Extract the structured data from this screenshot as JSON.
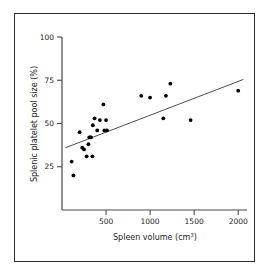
{
  "figure": {
    "background_color": "#ffffff",
    "frame_color": "#2b2b2b",
    "point_color": "#000000",
    "line_color": "#3a3a3a",
    "axis_color": "#4a4a4a"
  },
  "chart_data": {
    "type": "scatter",
    "title": "",
    "subtitle": "",
    "xlabel": "Spleen volume (cm",
    "xlabel_sup": "3",
    "xlabel_tail": ")",
    "xlabel_full": "Spleen volume (cm3)",
    "ylabel": "Splenic platelet pool size (%)",
    "xlim": [
      0,
      2100
    ],
    "ylim": [
      0,
      100
    ],
    "xticks": [
      500,
      1000,
      1500,
      2000
    ],
    "xtick_labels": [
      "500",
      "1000",
      "1500",
      "2000"
    ],
    "yticks": [
      25,
      50,
      75,
      100
    ],
    "ytick_labels": [
      "25",
      "50",
      "75",
      "100"
    ],
    "grid": false,
    "legend": null,
    "x": [
      110,
      130,
      200,
      230,
      250,
      280,
      300,
      310,
      320,
      330,
      345,
      350,
      370,
      400,
      430,
      470,
      480,
      500,
      510,
      900,
      1000,
      1150,
      1180,
      1230,
      1460,
      2000
    ],
    "y": [
      28,
      20,
      45,
      36,
      35,
      31,
      38,
      42,
      42,
      42,
      31,
      49,
      53,
      46,
      52,
      61,
      46,
      52,
      46,
      66,
      65,
      53,
      66,
      73,
      52,
      69
    ],
    "points": [
      {
        "x": 110,
        "y": 28
      },
      {
        "x": 130,
        "y": 20
      },
      {
        "x": 200,
        "y": 45
      },
      {
        "x": 230,
        "y": 36
      },
      {
        "x": 250,
        "y": 35
      },
      {
        "x": 280,
        "y": 31
      },
      {
        "x": 300,
        "y": 38
      },
      {
        "x": 310,
        "y": 42
      },
      {
        "x": 320,
        "y": 42
      },
      {
        "x": 330,
        "y": 42
      },
      {
        "x": 345,
        "y": 31
      },
      {
        "x": 350,
        "y": 49
      },
      {
        "x": 370,
        "y": 53
      },
      {
        "x": 400,
        "y": 46
      },
      {
        "x": 430,
        "y": 52
      },
      {
        "x": 470,
        "y": 61
      },
      {
        "x": 480,
        "y": 46
      },
      {
        "x": 500,
        "y": 52
      },
      {
        "x": 510,
        "y": 46
      },
      {
        "x": 900,
        "y": 66
      },
      {
        "x": 1000,
        "y": 65
      },
      {
        "x": 1150,
        "y": 53
      },
      {
        "x": 1180,
        "y": 66
      },
      {
        "x": 1230,
        "y": 73
      },
      {
        "x": 1460,
        "y": 52
      },
      {
        "x": 2000,
        "y": 69
      }
    ],
    "trendline": {
      "type": "linear-fit",
      "x1": 40,
      "y1": 36,
      "x2": 2060,
      "y2": 75.5
    },
    "point_count": 26
  }
}
